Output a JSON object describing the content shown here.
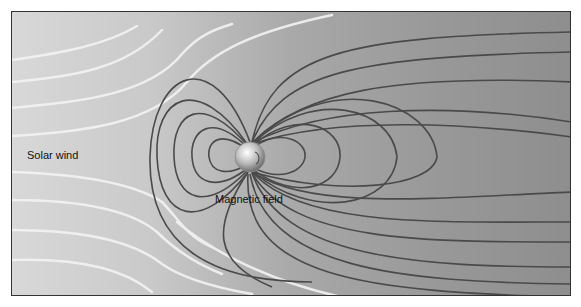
{
  "diagram": {
    "labels": {
      "solar_wind": "Solar wind",
      "magnetic_field": "Magnetic field"
    },
    "colors": {
      "field_line": "#4a4a4a",
      "solar_wind_line": "#eeeeee",
      "earth": "#cfcfcf"
    }
  }
}
